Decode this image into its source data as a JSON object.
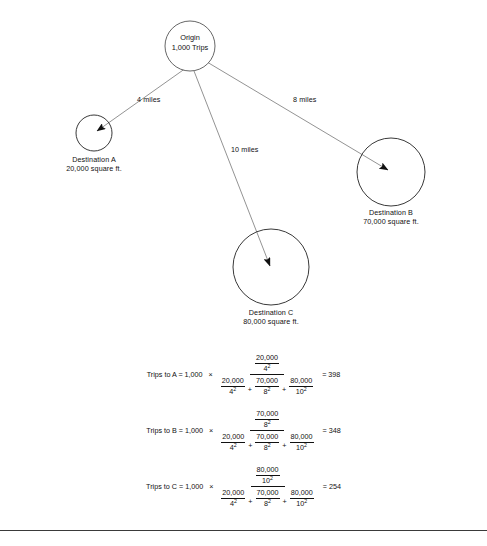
{
  "diagram": {
    "origin": {
      "name_line1": "Origin",
      "name_line2": "1,000  Trips",
      "trips": 1000
    },
    "destinations": [
      {
        "id": "A",
        "label": "Destination A",
        "size_label": "20,000 square ft.",
        "square_feet": 20000,
        "distance_label": "4 miles",
        "distance_miles": 4
      },
      {
        "id": "B",
        "label": "Destination B",
        "size_label": "70,000 square ft.",
        "square_feet": 70000,
        "distance_label": "8 miles",
        "distance_miles": 8
      },
      {
        "id": "C",
        "label": "Destination C",
        "size_label": "80,000 square ft.",
        "square_feet": 80000,
        "distance_label": "10 miles",
        "distance_miles": 10
      }
    ]
  },
  "formulas": [
    {
      "lead": "Trips to A = 1,000",
      "times": "×",
      "numerator": {
        "top": "20,000",
        "bottom": "4",
        "exp": "2"
      },
      "denominator": [
        {
          "top": "20,000",
          "bottom": "4",
          "exp": "2"
        },
        {
          "top": "70,000",
          "bottom": "8",
          "exp": "2"
        },
        {
          "top": "80,000",
          "bottom": "10",
          "exp": "2"
        }
      ],
      "plus": "+",
      "result": "= 398",
      "result_value": 398
    },
    {
      "lead": "Trips to B = 1,000",
      "times": "×",
      "numerator": {
        "top": "70,000",
        "bottom": "8",
        "exp": "2"
      },
      "denominator": [
        {
          "top": "20,000",
          "bottom": "4",
          "exp": "2"
        },
        {
          "top": "70,000",
          "bottom": "8",
          "exp": "2"
        },
        {
          "top": "80,000",
          "bottom": "10",
          "exp": "2"
        }
      ],
      "plus": "+",
      "result": "= 348",
      "result_value": 348
    },
    {
      "lead": "Trips to C = 1,000",
      "times": "×",
      "numerator": {
        "top": "80,000",
        "bottom": "10",
        "exp": "2"
      },
      "denominator": [
        {
          "top": "20,000",
          "bottom": "4",
          "exp": "2"
        },
        {
          "top": "70,000",
          "bottom": "8",
          "exp": "2"
        },
        {
          "top": "80,000",
          "bottom": "10",
          "exp": "2"
        }
      ],
      "plus": "+",
      "result": "= 254",
      "result_value": 254
    }
  ],
  "colors": {
    "stroke": "#555555",
    "text": "#111111",
    "rule": "#3a3a3a"
  }
}
